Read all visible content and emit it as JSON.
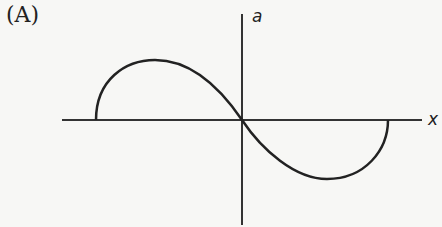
{
  "figure": {
    "option_label": "(A)",
    "y_axis_label": "a",
    "x_axis_label": "x",
    "curve_description": "Elliptical-arc S-shaped curve: semi-elliptical hump above x-axis on the left (vertical tangents at ends), passing through origin, semi-elliptical trough below x-axis on the right",
    "colors": {
      "line": "#222222",
      "background": "#f7f7f5"
    }
  }
}
